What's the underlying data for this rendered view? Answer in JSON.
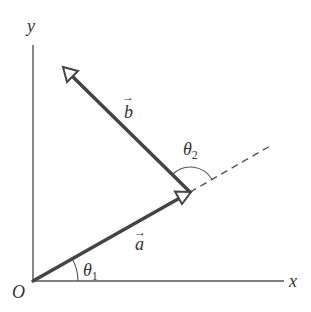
{
  "diagram": {
    "type": "vector-addition",
    "colors": {
      "vector": "#444444",
      "axis": "#555555",
      "dashed": "#555555",
      "text": "#333333",
      "background": "#ffffff"
    },
    "axes": {
      "x_label": "x",
      "y_label": "y",
      "origin_label": "O"
    },
    "vectors": [
      {
        "name": "a",
        "label": "a",
        "arrow_glyph": "→",
        "from": "O",
        "to": "tip of a"
      },
      {
        "name": "b",
        "label": "b",
        "arrow_glyph": "→",
        "from": "tip of a",
        "to": "upper left"
      }
    ],
    "angles": [
      {
        "name": "theta1",
        "symbol": "θ",
        "subscript": "1",
        "between": "x-axis and a"
      },
      {
        "name": "theta2",
        "symbol": "θ",
        "subscript": "2",
        "between": "extension of a and b"
      }
    ],
    "extension": {
      "style": "dashed",
      "description": "extension of vector a"
    }
  }
}
